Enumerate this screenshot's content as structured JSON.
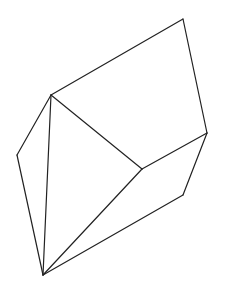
{
  "diagram": {
    "type": "polyhedron-line-drawing",
    "stroke_color": "#222222",
    "background": "#ffffff",
    "vertices": {
      "A": [
        51,
        95
      ],
      "B": [
        183,
        19
      ],
      "C": [
        207,
        133
      ],
      "D": [
        142,
        169
      ],
      "E": [
        183,
        195
      ],
      "F": [
        43,
        275
      ],
      "G": [
        17,
        155
      ]
    },
    "edges": [
      [
        "A",
        "B"
      ],
      [
        "B",
        "C"
      ],
      [
        "C",
        "D"
      ],
      [
        "D",
        "A"
      ],
      [
        "C",
        "E"
      ],
      [
        "E",
        "F"
      ],
      [
        "F",
        "D"
      ],
      [
        "F",
        "A"
      ],
      [
        "F",
        "G"
      ],
      [
        "G",
        "A"
      ]
    ]
  }
}
